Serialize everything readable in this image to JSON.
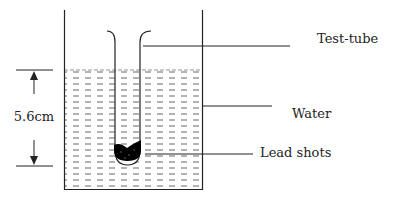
{
  "diagram": {
    "type": "physics-apparatus",
    "labels": {
      "test_tube": "Test-tube",
      "water": "Water",
      "lead_shots": "Lead shots",
      "depth": "5.6cm"
    },
    "colors": {
      "line": "#222222",
      "water_dash": "#555555",
      "lead": "#000000",
      "background": "#ffffff"
    }
  }
}
